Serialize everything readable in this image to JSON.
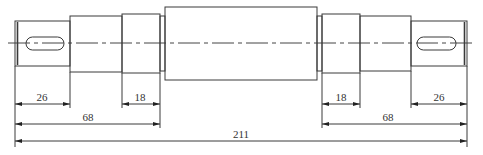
{
  "drawing": {
    "type": "stepped-shaft-technical-drawing",
    "line_color": "#3a3a3a",
    "background": "#ffffff",
    "centerline_y": 43
  },
  "shaft_sections": [
    {
      "name": "left-journal-end",
      "x1": 15,
      "x2": 70,
      "y1": 21,
      "y2": 66,
      "keyway": true
    },
    {
      "name": "left-step-2",
      "x1": 70,
      "x2": 122,
      "y1": 16,
      "y2": 72
    },
    {
      "name": "left-bearing-seat",
      "x1": 122,
      "x2": 160,
      "y1": 14,
      "y2": 73
    },
    {
      "name": "left-shoulder",
      "x1": 160,
      "x2": 165,
      "y1": 16,
      "y2": 71
    },
    {
      "name": "main-body",
      "x1": 165,
      "x2": 317,
      "y1": 7,
      "y2": 80
    },
    {
      "name": "right-shoulder",
      "x1": 317,
      "x2": 322,
      "y1": 16,
      "y2": 71
    },
    {
      "name": "right-bearing-seat",
      "x1": 322,
      "x2": 360,
      "y1": 14,
      "y2": 73
    },
    {
      "name": "right-step-2",
      "x1": 360,
      "x2": 411,
      "y1": 16,
      "y2": 71
    },
    {
      "name": "right-journal-end",
      "x1": 411,
      "x2": 467,
      "y1": 21,
      "y2": 66,
      "keyway": true
    }
  ],
  "keyways": [
    {
      "name": "left-keyway",
      "x1": 26,
      "x2": 64,
      "y1": 37,
      "y2": 50
    },
    {
      "name": "right-keyway",
      "x1": 417,
      "x2": 456,
      "y1": 37,
      "y2": 50
    }
  ],
  "dimensions": [
    {
      "name": "dim-left-end-length",
      "label": "26",
      "x1": 15,
      "x2": 70,
      "y": 104
    },
    {
      "name": "dim-left-bearing-length",
      "label": "18",
      "x1": 122,
      "x2": 160,
      "y": 104
    },
    {
      "name": "dim-right-bearing-length",
      "label": "18",
      "x1": 322,
      "x2": 360,
      "y": 104
    },
    {
      "name": "dim-right-end-length",
      "label": "26",
      "x1": 411,
      "x2": 467,
      "y": 104
    },
    {
      "name": "dim-left-overall-section",
      "label": "68",
      "x1": 15,
      "x2": 160,
      "y": 124
    },
    {
      "name": "dim-right-overall-section",
      "label": "68",
      "x1": 322,
      "x2": 467,
      "y": 124
    },
    {
      "name": "dim-total-length",
      "label": "211",
      "x1": 15,
      "x2": 467,
      "y": 141
    }
  ]
}
